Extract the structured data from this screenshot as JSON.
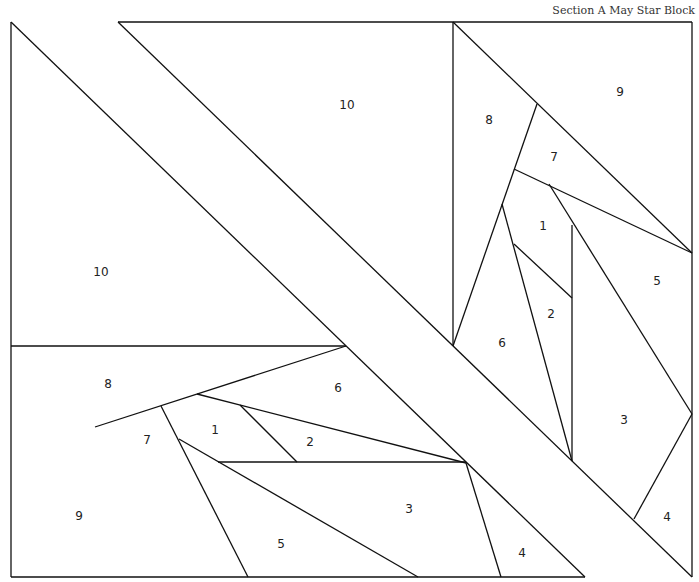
{
  "title": "Section A May Star Block",
  "labels": {
    "tl_10_top": "10",
    "tl_10_left": "10",
    "tr_9": "9",
    "tr_8": "8",
    "tr_7": "7",
    "tr_1": "1",
    "tr_5": "5",
    "tr_2": "2",
    "tr_6": "6",
    "tr_3": "3",
    "tr_4": "4",
    "bl_8": "8",
    "bl_6": "6",
    "bl_7": "7",
    "bl_1": "1",
    "bl_2": "2",
    "bl_9": "9",
    "bl_3": "3",
    "bl_5": "5",
    "bl_4": "4"
  }
}
